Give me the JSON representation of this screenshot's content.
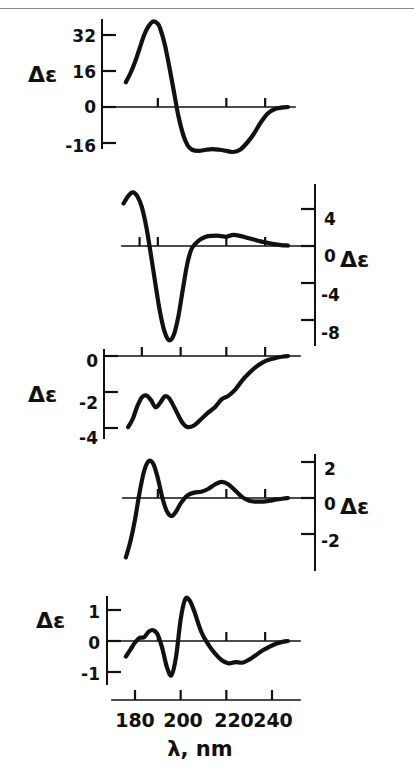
{
  "figure": {
    "name": "circular-dichroism-spectra-figure",
    "x_axis": {
      "title": "λ, nm",
      "tick_labels": [
        "180",
        "200",
        "220",
        "240"
      ],
      "tick_values": [
        180,
        200,
        220,
        240
      ],
      "range": [
        172,
        248
      ],
      "unit": "nm"
    },
    "panels": [
      {
        "id": "panel-1",
        "axis_label": "Δε",
        "axis_side": "left",
        "y_tick_labels": [
          "32",
          "16",
          "0",
          "-16"
        ],
        "y_tick_values": [
          32,
          16,
          0,
          -16
        ],
        "ylim": [
          -22,
          40
        ]
      },
      {
        "id": "panel-2",
        "axis_label": "Δε",
        "axis_side": "right",
        "y_tick_labels": [
          "4",
          "0",
          "-4",
          "-8"
        ],
        "y_tick_values": [
          4,
          0,
          -4,
          -8
        ],
        "ylim": [
          -11,
          7
        ]
      },
      {
        "id": "panel-3",
        "axis_label": "Δε",
        "axis_side": "left",
        "y_tick_labels": [
          "0",
          "-2",
          "-4"
        ],
        "y_tick_values": [
          0,
          -2,
          -4
        ],
        "ylim": [
          -4.6,
          0.4
        ]
      },
      {
        "id": "panel-4",
        "axis_label": "Δε",
        "axis_side": "right",
        "y_tick_labels": [
          "2",
          "0",
          "-2"
        ],
        "y_tick_values": [
          2,
          0,
          -2
        ],
        "ylim": [
          -3.4,
          2.6
        ]
      },
      {
        "id": "panel-5",
        "axis_label": "Δε",
        "axis_side": "left",
        "y_tick_labels": [
          "1",
          "0",
          "-1"
        ],
        "y_tick_values": [
          1,
          0,
          -1
        ],
        "ylim": [
          -1.5,
          1.7
        ]
      }
    ]
  },
  "chart_data": {
    "type": "line",
    "title": "",
    "subtitle": "",
    "xlabel": "λ, nm",
    "ylabel": "Δε",
    "grid": false,
    "legend": "none",
    "x_ticks": [
      180,
      200,
      220,
      240
    ],
    "xlim": [
      172,
      248
    ],
    "panels": [
      {
        "name": "panel-1",
        "ylabel": "Δε",
        "y_ticks": [
          32,
          16,
          0,
          -16
        ],
        "ylim": [
          -22,
          40
        ],
        "axis_side": "left",
        "series": [
          {
            "name": "spectrum-1",
            "x": [
              176,
              178,
              180,
              182,
              184,
              186,
              188,
              190,
              191,
              193,
              195,
              197,
              199,
              201,
              203,
              205,
              208,
              211,
              214,
              217,
              220,
              223,
              226,
              229,
              232,
              235,
              238,
              241,
              244,
              247
            ],
            "y": [
              11,
              15,
              20,
              26,
              32,
              36,
              38,
              37,
              35,
              28,
              18,
              7,
              -4,
              -12,
              -17,
              -19,
              -19.5,
              -19,
              -18.7,
              -19,
              -19.5,
              -20,
              -19,
              -16,
              -12,
              -7,
              -3,
              -1,
              -0.3,
              0
            ]
          }
        ]
      },
      {
        "name": "panel-2",
        "ylabel": "Δε",
        "y_ticks": [
          4,
          0,
          -4,
          -8
        ],
        "ylim": [
          -11,
          7
        ],
        "axis_side": "right",
        "series": [
          {
            "name": "spectrum-2",
            "x": [
              175,
              177,
              179,
              181,
              183,
              185,
              187,
              189,
              191,
              193,
              195,
              197,
              199,
              201,
              203,
              205,
              208,
              211,
              214,
              217,
              220,
              223,
              226,
              229,
              232,
              235,
              238,
              241,
              244,
              247
            ],
            "y": [
              4.6,
              5.4,
              5.8,
              5.4,
              4.2,
              2.0,
              -1.0,
              -4.2,
              -7.2,
              -9.3,
              -10.2,
              -9.6,
              -7.6,
              -4.6,
              -1.8,
              -0.2,
              0.6,
              1.0,
              1.1,
              1.1,
              1.0,
              1.2,
              1.1,
              0.9,
              0.7,
              0.5,
              0.35,
              0.2,
              0.1,
              0.05
            ]
          }
        ]
      },
      {
        "name": "panel-3",
        "ylabel": "Δε",
        "y_ticks": [
          0,
          -2,
          -4
        ],
        "ylim": [
          -4.6,
          0.4
        ],
        "axis_side": "left",
        "series": [
          {
            "name": "spectrum-3",
            "x": [
              177,
              179,
              181,
              183,
              185,
              187,
              189,
              191,
              193,
              195,
              197,
              199,
              201,
              203,
              206,
              209,
              212,
              215,
              218,
              221,
              224,
              227,
              230,
              233,
              236,
              239,
              242,
              245,
              247
            ],
            "y": [
              -3.95,
              -3.5,
              -2.8,
              -2.3,
              -2.2,
              -2.45,
              -2.85,
              -2.6,
              -2.25,
              -2.35,
              -2.8,
              -3.3,
              -3.75,
              -3.95,
              -3.85,
              -3.5,
              -3.15,
              -2.85,
              -2.4,
              -2.2,
              -1.85,
              -1.35,
              -0.95,
              -0.6,
              -0.35,
              -0.2,
              -0.1,
              -0.03,
              0
            ]
          }
        ]
      },
      {
        "name": "panel-4",
        "ylabel": "Δε",
        "y_ticks": [
          2,
          0,
          -2
        ],
        "ylim": [
          -3.4,
          2.6
        ],
        "axis_side": "right",
        "series": [
          {
            "name": "spectrum-4",
            "x": [
              176,
              178,
              180,
              182,
              184,
              186,
              188,
              190,
              192,
              194,
              196,
              198,
              200,
              203,
              206,
              209,
              212,
              215,
              218,
              221,
              224,
              227,
              230,
              233,
              236,
              239,
              242,
              245,
              247
            ],
            "y": [
              -3.3,
              -2.4,
              -1.2,
              0.3,
              1.5,
              2.05,
              1.9,
              1.1,
              0.0,
              -0.75,
              -1.0,
              -0.75,
              -0.3,
              0.15,
              0.3,
              0.35,
              0.5,
              0.75,
              0.9,
              0.75,
              0.4,
              0.05,
              -0.15,
              -0.2,
              -0.2,
              -0.15,
              -0.08,
              -0.03,
              0
            ]
          }
        ]
      },
      {
        "name": "panel-5",
        "ylabel": "Δε",
        "y_ticks": [
          1,
          0,
          -1
        ],
        "ylim": [
          -1.5,
          1.7
        ],
        "axis_side": "left",
        "series": [
          {
            "name": "spectrum-5",
            "x": [
              176,
              178,
              180,
              182,
              184,
              186,
              188,
              190,
              192,
              194,
              196,
              198,
              200,
              202,
              204,
              206,
              209,
              212,
              215,
              218,
              221,
              224,
              227,
              230,
              233,
              236,
              239,
              242,
              245,
              247
            ],
            "y": [
              -0.5,
              -0.28,
              -0.05,
              0.1,
              0.12,
              0.3,
              0.35,
              0.2,
              -0.25,
              -0.85,
              -1.1,
              -0.5,
              0.7,
              1.35,
              1.3,
              0.95,
              0.3,
              -0.1,
              -0.4,
              -0.62,
              -0.72,
              -0.68,
              -0.7,
              -0.6,
              -0.45,
              -0.3,
              -0.18,
              -0.08,
              -0.02,
              0
            ]
          }
        ]
      }
    ]
  }
}
